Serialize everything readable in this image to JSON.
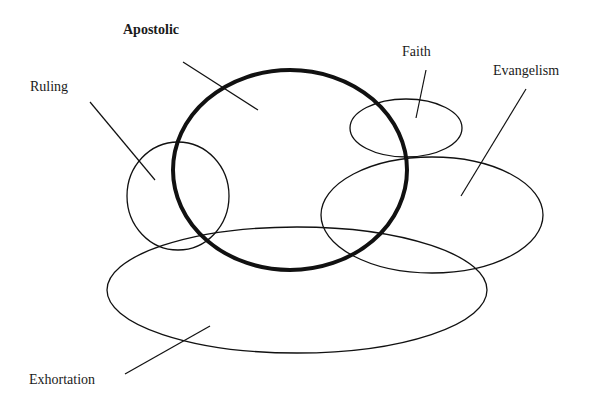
{
  "diagram": {
    "stroke_color": "#111111",
    "background": "#ffffff",
    "nodes": [
      {
        "id": "apostolic",
        "label": "Apostolic",
        "bold": true,
        "cx": 290,
        "cy": 170,
        "rx": 117,
        "ry": 100,
        "stroke_width": 4,
        "label_x": 123,
        "label_y": 22,
        "leader": [
          183,
          62,
          258,
          110
        ]
      },
      {
        "id": "ruling",
        "label": "Ruling",
        "bold": false,
        "cx": 178,
        "cy": 196,
        "rx": 51,
        "ry": 54,
        "stroke_width": 1.3,
        "label_x": 30,
        "label_y": 79,
        "leader": [
          90,
          102,
          155,
          180
        ]
      },
      {
        "id": "faith",
        "label": "Faith",
        "bold": false,
        "cx": 406,
        "cy": 128,
        "rx": 56,
        "ry": 29,
        "stroke_width": 1.3,
        "label_x": 402,
        "label_y": 44,
        "leader": [
          426,
          70,
          416,
          118
        ]
      },
      {
        "id": "evangelism",
        "label": "Evangelism",
        "bold": false,
        "cx": 432,
        "cy": 215,
        "rx": 111,
        "ry": 58,
        "stroke_width": 1.3,
        "label_x": 493,
        "label_y": 63,
        "leader": [
          526,
          89,
          461,
          196
        ]
      },
      {
        "id": "exhortation",
        "label": "Exhortation",
        "bold": false,
        "cx": 297,
        "cy": 290,
        "rx": 190,
        "ry": 63,
        "stroke_width": 1.3,
        "label_x": 29,
        "label_y": 372,
        "leader": [
          125,
          374,
          210,
          326
        ]
      }
    ]
  }
}
